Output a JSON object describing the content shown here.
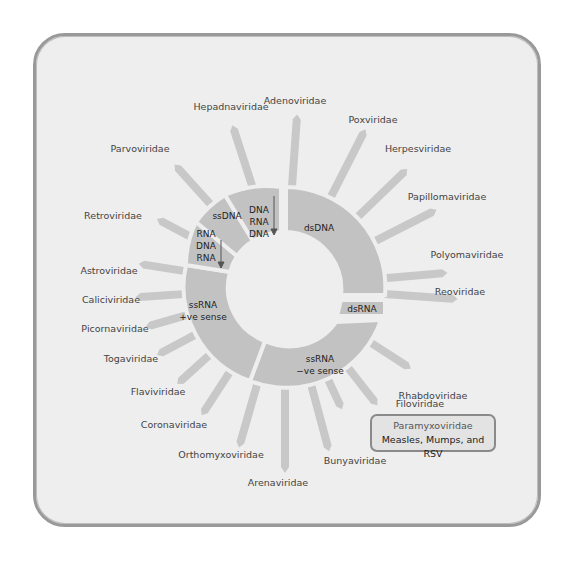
{
  "diagram": {
    "colors": {
      "frame_border": "#999999",
      "background": "#eeeeee",
      "segment_fill": "#c2c2c2",
      "spoke_fill": "#c8c8c8",
      "label_text": "#444444"
    },
    "segments": [
      {
        "id": "dsDNA",
        "label": "dsDNA"
      },
      {
        "id": "rt-dna",
        "lines": [
          "DNA",
          "RNA",
          "DNA"
        ]
      },
      {
        "id": "ssDNA",
        "label": "ssDNA"
      },
      {
        "id": "rt-rna",
        "lines": [
          "RNA",
          "DNA",
          "RNA"
        ]
      },
      {
        "id": "ss-pos",
        "lines": [
          "ssRNA",
          "+ve sense"
        ]
      },
      {
        "id": "ss-neg",
        "lines": [
          "ssRNA",
          "−ve sense"
        ]
      },
      {
        "id": "dsRNA",
        "label": "dsRNA"
      }
    ],
    "families": [
      {
        "name": "Adenoviridae",
        "group": "dsDNA"
      },
      {
        "name": "Poxviridae",
        "group": "dsDNA"
      },
      {
        "name": "Herpesviridae",
        "group": "dsDNA"
      },
      {
        "name": "Papillomaviridae",
        "group": "dsDNA"
      },
      {
        "name": "Polyomaviridae",
        "group": "dsDNA"
      },
      {
        "name": "Reoviridae",
        "group": "dsRNA"
      },
      {
        "name": "Rhabdoviridae",
        "group": "ssRNA -ve sense"
      },
      {
        "name": "Filoviridae",
        "group": "ssRNA -ve sense"
      },
      {
        "name": "Bunyaviridae",
        "group": "ssRNA -ve sense"
      },
      {
        "name": "Arenaviridae",
        "group": "ssRNA -ve sense"
      },
      {
        "name": "Orthomyxoviridae",
        "group": "ssRNA -ve sense"
      },
      {
        "name": "Coronaviridae",
        "group": "ssRNA +ve sense"
      },
      {
        "name": "Flaviviridae",
        "group": "ssRNA +ve sense"
      },
      {
        "name": "Togaviridae",
        "group": "ssRNA +ve sense"
      },
      {
        "name": "Picornaviridae",
        "group": "ssRNA +ve sense"
      },
      {
        "name": "Caliciviridae",
        "group": "ssRNA +ve sense"
      },
      {
        "name": "Astroviridae",
        "group": "ssRNA +ve sense"
      },
      {
        "name": "Retroviridae",
        "group": "RNA-DNA-RNA"
      },
      {
        "name": "Parvoviridae",
        "group": "ssDNA"
      },
      {
        "name": "Hepadnaviridae",
        "group": "DNA-RNA-DNA"
      }
    ],
    "callout": {
      "title": "Paramyxoviridae",
      "subtitle": "Measles, Mumps, and RSV"
    }
  }
}
